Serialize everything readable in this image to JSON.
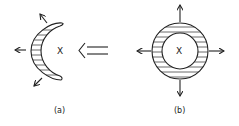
{
  "diagram": {
    "panel_a": {
      "label": "(a)",
      "center_mark": "X",
      "shape": "crescent",
      "hatching": "horizontal",
      "outward_arrows": [
        "up-left",
        "left",
        "down-left"
      ]
    },
    "transition_arrow": {
      "direction": "left",
      "style": "double-line"
    },
    "panel_b": {
      "label": "(b)",
      "center_mark": "X",
      "shape": "annulus",
      "hatching": "horizontal",
      "outward_arrows": [
        "up",
        "left",
        "right",
        "down"
      ]
    },
    "colors": {
      "stroke": "#222222",
      "background": "#ffffff"
    }
  }
}
